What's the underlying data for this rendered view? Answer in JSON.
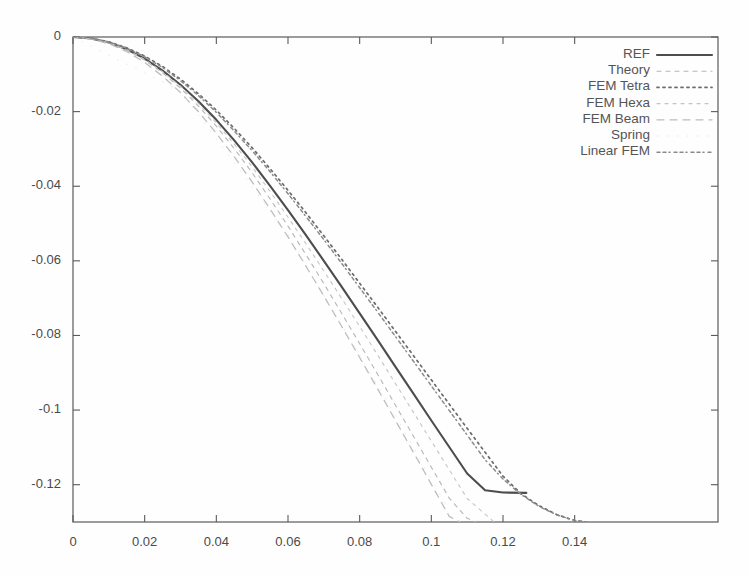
{
  "chart_data": {
    "type": "line",
    "title": "",
    "xlabel": "",
    "ylabel": "",
    "xlim": [
      0,
      0.18
    ],
    "ylim": [
      -0.13,
      0
    ],
    "xticks": [
      "0",
      "0.02",
      "0.04",
      "0.06",
      "0.08",
      "0.1",
      "0.12",
      "0.14"
    ],
    "xtick_values": [
      0,
      0.02,
      0.04,
      0.06,
      0.08,
      0.1,
      0.12,
      0.14
    ],
    "yticks": [
      "0",
      "-0.02",
      "-0.04",
      "-0.06",
      "-0.08",
      "-0.1",
      "-0.12"
    ],
    "ytick_values": [
      0,
      -0.02,
      -0.04,
      -0.06,
      -0.08,
      -0.1,
      -0.12
    ],
    "grid": false,
    "legend_position": "top-right",
    "series": [
      {
        "name": "REF",
        "style": "solid",
        "color": "#4d4d4d",
        "width": 2.1,
        "x": [
          0,
          0.005,
          0.01,
          0.015,
          0.02,
          0.025,
          0.03,
          0.035,
          0.04,
          0.045,
          0.05,
          0.055,
          0.06,
          0.065,
          0.07,
          0.075,
          0.08,
          0.085,
          0.09,
          0.095,
          0.1,
          0.105,
          0.11,
          0.115,
          0.12,
          0.1265
        ],
        "y": [
          0,
          -0.0004,
          -0.0015,
          -0.0033,
          -0.0058,
          -0.009,
          -0.0128,
          -0.0172,
          -0.0222,
          -0.0277,
          -0.0336,
          -0.0399,
          -0.0464,
          -0.0531,
          -0.06,
          -0.067,
          -0.0741,
          -0.0812,
          -0.0884,
          -0.0956,
          -0.1028,
          -0.1099,
          -0.117,
          -0.1215,
          -0.1221,
          -0.1222
        ]
      },
      {
        "name": "Theory",
        "style": "dash-fine",
        "color": "#b5b5b5",
        "width": 1.1,
        "x": [
          0,
          0.005,
          0.01,
          0.015,
          0.02,
          0.025,
          0.03,
          0.035,
          0.04,
          0.045,
          0.05,
          0.055,
          0.06,
          0.065,
          0.07,
          0.075,
          0.08,
          0.085,
          0.09,
          0.095,
          0.1,
          0.105,
          0.11,
          0.1125
        ],
        "y": [
          0,
          -0.0004,
          -0.0016,
          -0.0035,
          -0.0062,
          -0.0096,
          -0.0137,
          -0.0185,
          -0.0239,
          -0.0299,
          -0.0364,
          -0.0434,
          -0.0507,
          -0.0583,
          -0.0661,
          -0.0741,
          -0.0822,
          -0.0904,
          -0.0987,
          -0.107,
          -0.1153,
          -0.1236,
          -0.129,
          -0.13
        ]
      },
      {
        "name": "FEM Tetra",
        "style": "dotted",
        "color": "#6b6b6b",
        "width": 1.7,
        "x": [
          0,
          0.005,
          0.01,
          0.015,
          0.02,
          0.025,
          0.03,
          0.035,
          0.04,
          0.045,
          0.05,
          0.055,
          0.06,
          0.065,
          0.07,
          0.075,
          0.08,
          0.085,
          0.09,
          0.095,
          0.1,
          0.105,
          0.11,
          0.115,
          0.12,
          0.125,
          0.13,
          0.135,
          0.14,
          0.1432
        ],
        "y": [
          0,
          -0.0003,
          -0.0013,
          -0.0029,
          -0.0051,
          -0.0079,
          -0.0113,
          -0.0152,
          -0.0196,
          -0.0245,
          -0.0297,
          -0.0353,
          -0.0411,
          -0.0471,
          -0.0533,
          -0.0596,
          -0.066,
          -0.0724,
          -0.0789,
          -0.0854,
          -0.0919,
          -0.0984,
          -0.1049,
          -0.1113,
          -0.1177,
          -0.1224,
          -0.1256,
          -0.128,
          -0.1296,
          -0.13
        ]
      },
      {
        "name": "FEM Hexa",
        "style": "dash-fine2",
        "color": "#c4c4c4",
        "width": 1.1,
        "x": [
          0,
          0.005,
          0.01,
          0.015,
          0.02,
          0.025,
          0.03,
          0.035,
          0.04,
          0.045,
          0.05,
          0.055,
          0.06,
          0.065,
          0.07,
          0.075,
          0.08,
          0.085,
          0.09,
          0.095,
          0.1,
          0.105,
          0.11,
          0.1175
        ],
        "y": [
          0,
          -0.0004,
          -0.0015,
          -0.0034,
          -0.006,
          -0.0093,
          -0.0132,
          -0.0178,
          -0.023,
          -0.0287,
          -0.0348,
          -0.0414,
          -0.0483,
          -0.0554,
          -0.0627,
          -0.0701,
          -0.0776,
          -0.0852,
          -0.0929,
          -0.1006,
          -0.1083,
          -0.116,
          -0.1237,
          -0.13
        ]
      },
      {
        "name": "FEM Beam",
        "style": "dashed",
        "color": "#bdbdbd",
        "width": 1.3,
        "x": [
          0,
          0.005,
          0.01,
          0.015,
          0.02,
          0.025,
          0.03,
          0.035,
          0.04,
          0.045,
          0.05,
          0.055,
          0.06,
          0.065,
          0.07,
          0.075,
          0.08,
          0.085,
          0.09,
          0.095,
          0.1,
          0.105,
          0.108
        ],
        "y": [
          0,
          -0.0005,
          -0.0018,
          -0.0039,
          -0.0068,
          -0.0105,
          -0.0149,
          -0.02,
          -0.0258,
          -0.0321,
          -0.0389,
          -0.0461,
          -0.0536,
          -0.0614,
          -0.0694,
          -0.0776,
          -0.0859,
          -0.0943,
          -0.1028,
          -0.1113,
          -0.1199,
          -0.1285,
          -0.13
        ]
      },
      {
        "name": "Spring",
        "style": "none",
        "color": "#e8e8e8",
        "width": 0.9,
        "x": [
          0,
          0.03,
          0.06,
          0.09,
          0.105
        ],
        "y": [
          0,
          -0.0145,
          -0.053,
          -0.1015,
          -0.127
        ]
      },
      {
        "name": "Linear FEM",
        "style": "dash-dot",
        "color": "#8a8a8a",
        "width": 1.5,
        "x": [
          0,
          0.005,
          0.01,
          0.015,
          0.02,
          0.025,
          0.03,
          0.035,
          0.04,
          0.045,
          0.05,
          0.055,
          0.06,
          0.065,
          0.07,
          0.075,
          0.08,
          0.085,
          0.09,
          0.095,
          0.1,
          0.105,
          0.11,
          0.115,
          0.12,
          0.125,
          0.13,
          0.135,
          0.14,
          0.1435
        ],
        "y": [
          0,
          -0.0003,
          -0.0013,
          -0.003,
          -0.0053,
          -0.0082,
          -0.0117,
          -0.0157,
          -0.0202,
          -0.0252,
          -0.0305,
          -0.0361,
          -0.042,
          -0.0481,
          -0.0543,
          -0.0607,
          -0.0672,
          -0.0737,
          -0.0803,
          -0.0869,
          -0.0935,
          -0.1001,
          -0.1067,
          -0.1133,
          -0.1185,
          -0.1226,
          -0.1258,
          -0.1281,
          -0.1296,
          -0.13
        ]
      }
    ]
  },
  "legend": {
    "entries": [
      {
        "label": "REF"
      },
      {
        "label": "Theory"
      },
      {
        "label": "FEM Tetra"
      },
      {
        "label": "FEM Hexa"
      },
      {
        "label": "FEM Beam"
      },
      {
        "label": "Spring"
      },
      {
        "label": "Linear FEM"
      }
    ]
  },
  "colors": {
    "axis": "#5a5a5a",
    "text": "#4a4a4a",
    "background": "#fefefe"
  }
}
